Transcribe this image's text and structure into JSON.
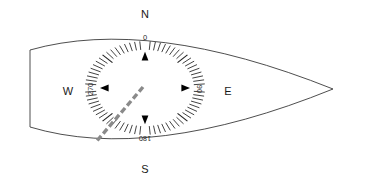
{
  "figure": {
    "background_color": "#ffffff",
    "outline_color": "#3a3a3a",
    "tick_color": "#2e2e2e",
    "needle_color": "#8a8a8a",
    "label_color": "#1a1a1a"
  },
  "compass": {
    "center_x": 145,
    "center_y": 88,
    "tick_outer_radius": 60,
    "tick_inner_radius": 49,
    "tick_count": 72,
    "tick_step_degrees": 5,
    "cardinals": [
      {
        "name": "north",
        "label": "N",
        "x": 145,
        "y": 15,
        "bearing": 0
      },
      {
        "name": "east",
        "label": "E",
        "x": 228,
        "y": 92,
        "bearing": 90
      },
      {
        "name": "south",
        "label": "S",
        "x": 145,
        "y": 170,
        "bearing": 180
      },
      {
        "name": "west",
        "label": "W",
        "x": 68,
        "y": 92,
        "bearing": 270
      }
    ],
    "degree_marks": [
      {
        "name": "degree-000",
        "label": "0",
        "bearing": 0,
        "x": 145,
        "y": 38,
        "rotation": 0
      },
      {
        "name": "degree-090",
        "label": "90",
        "bearing": 90,
        "x": 199,
        "y": 89,
        "rotation": 90
      },
      {
        "name": "degree-180",
        "label": "180",
        "bearing": 180,
        "x": 145,
        "y": 138,
        "rotation": 180
      },
      {
        "name": "degree-270",
        "label": "270",
        "bearing": 270,
        "x": 91,
        "y": 89,
        "rotation": 270
      }
    ],
    "pointers": [
      {
        "name": "pointer-north",
        "bearing": 0,
        "direction": "up"
      },
      {
        "name": "pointer-east",
        "bearing": 90,
        "direction": "right"
      },
      {
        "name": "pointer-south",
        "bearing": 180,
        "direction": "down"
      },
      {
        "name": "pointer-west",
        "bearing": 270,
        "direction": "left"
      }
    ]
  },
  "needle": {
    "name": "heading-needle",
    "style": "dashed",
    "color": "#8a8a8a",
    "start_x": 143,
    "start_y": 87,
    "end_x": 96,
    "end_y": 142,
    "bearing_degrees": 220
  },
  "hull": {
    "name": "hull-outline",
    "description": "lens shaped boat hull, flat transom at left, pointed bow at right",
    "bow_tip_x": 333,
    "bow_tip_y": 89,
    "transom_top_x": 30,
    "transom_top_y": 50,
    "transom_bottom_x": 30,
    "transom_bottom_y": 127,
    "top_apex_x": 150,
    "top_apex_y": 22,
    "bottom_apex_x": 150,
    "bottom_apex_y": 157
  }
}
